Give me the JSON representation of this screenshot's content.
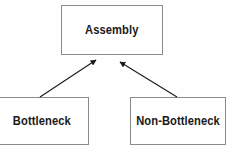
{
  "diagram": {
    "background_color": "#fefefe",
    "box_face_color": "#ffffff",
    "box_border_color": "#8a8a8a",
    "box_shadow_color": "#111111",
    "text_color": "#1a1a1a",
    "arrow_color": "#1a1a1a",
    "nodes": [
      {
        "id": "assembly",
        "label": "Assembly",
        "x": 61,
        "y": 5,
        "width": 102,
        "height": 50
      },
      {
        "id": "bottleneck",
        "label": "Bottleneck",
        "x": -14,
        "y": 97,
        "width": 103,
        "height": 48
      },
      {
        "id": "nonbottleneck",
        "label": "Non-Bottleneck",
        "x": 130,
        "y": 97,
        "width": 96,
        "height": 48
      }
    ],
    "edges": [
      {
        "id": "bottleneck-to-assembly",
        "from": "bottleneck",
        "to": "assembly",
        "arrowhead": "filled-triangle",
        "x1": 40,
        "y1": 97,
        "x2": 96,
        "y2": 60
      },
      {
        "id": "nonbottleneck-to-assembly",
        "from": "nonbottleneck",
        "to": "assembly",
        "arrowhead": "filled-triangle",
        "x1": 177,
        "y1": 97,
        "x2": 120,
        "y2": 62
      }
    ]
  }
}
